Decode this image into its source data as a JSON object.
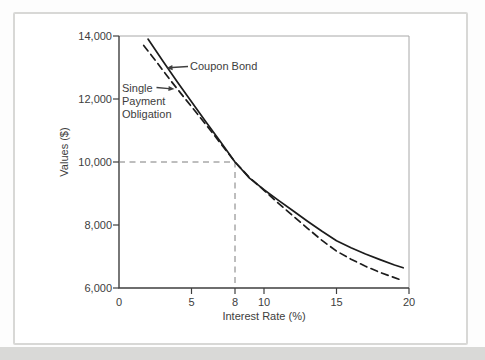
{
  "figure": {
    "background_color": "#ffffff",
    "card_border_color": "#d8d8d6",
    "bottom_strip_color": "#d9d9d7",
    "text_color": "#3d3d3d",
    "curve_color": "#1c1c1c",
    "reference_line_color": "#7d7d7d"
  },
  "chart_data": {
    "type": "line",
    "title": "",
    "xlabel": "Interest Rate (%)",
    "ylabel": "Values ($)",
    "xlim": [
      0,
      20
    ],
    "ylim": [
      6000,
      14000
    ],
    "grid": false,
    "legend_position": "inline-annotations",
    "xticks": {
      "values": [
        0,
        5,
        8,
        10,
        15,
        20
      ],
      "labels": [
        "0",
        "5",
        "8",
        "10",
        "15",
        "20"
      ]
    },
    "yticks": {
      "values": [
        6000,
        8000,
        10000,
        12000,
        14000
      ],
      "labels": [
        "6,000",
        "8,000",
        "10,000",
        "12,000",
        "14,000"
      ]
    },
    "reference_lines": {
      "x": 8,
      "y": 10000,
      "style": "dashed"
    },
    "series": [
      {
        "name": "Single Payment Obligation",
        "line_style": "dashed",
        "color": "#1c1c1c",
        "points": [
          [
            1.7,
            13700
          ],
          [
            2.5,
            13230
          ],
          [
            3.5,
            12620
          ],
          [
            4.5,
            12040
          ],
          [
            5.5,
            11470
          ],
          [
            6.5,
            10890
          ],
          [
            7.5,
            10300
          ],
          [
            8,
            10000
          ],
          [
            9,
            9505
          ],
          [
            10,
            9100
          ],
          [
            11,
            8690
          ],
          [
            12,
            8290
          ],
          [
            13,
            7895
          ],
          [
            14,
            7510
          ],
          [
            15,
            7170
          ],
          [
            16,
            6915
          ],
          [
            17,
            6690
          ],
          [
            18,
            6495
          ],
          [
            19.3,
            6280
          ]
        ]
      },
      {
        "name": "Coupon Bond",
        "line_style": "solid",
        "color": "#1c1c1c",
        "points": [
          [
            2,
            13900
          ],
          [
            3,
            13225
          ],
          [
            4,
            12560
          ],
          [
            5,
            11910
          ],
          [
            6,
            11270
          ],
          [
            7,
            10640
          ],
          [
            8,
            10000
          ],
          [
            9,
            9490
          ],
          [
            10,
            9120
          ],
          [
            11,
            8780
          ],
          [
            12,
            8450
          ],
          [
            13,
            8120
          ],
          [
            14,
            7800
          ],
          [
            15,
            7500
          ],
          [
            16,
            7280
          ],
          [
            17,
            7080
          ],
          [
            18,
            6900
          ],
          [
            19,
            6730
          ],
          [
            19.6,
            6640
          ]
        ]
      }
    ],
    "annotations": [
      {
        "label": "Coupon Bond",
        "arrow": "left-to-solid-curve"
      },
      {
        "label": "Single Payment Obligation",
        "lines": [
          "Single",
          "Payment",
          "Obligation"
        ],
        "arrow": "right-to-dashed-curve"
      }
    ]
  }
}
